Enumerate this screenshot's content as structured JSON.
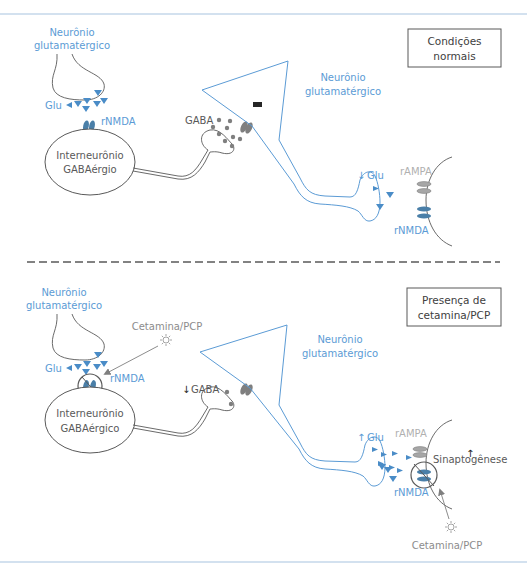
{
  "colors": {
    "neuron_blue": "#5b9bd5",
    "glu_marker": "#4a8cc7",
    "receptor_nmda": "#4a7fa8",
    "receptor_gray": "#8c8c8c",
    "gaba_dot": "#7f7f7f",
    "outline": "#595959",
    "frame_line": "#a8c4e0",
    "ketamine": "#999999"
  },
  "panels": [
    {
      "id": "normal",
      "condition_box": {
        "line1": "Condições",
        "line2": "normais"
      },
      "presynaptic_neuron": {
        "line1": "Neurônio",
        "line2": "glutamatérgico"
      },
      "glu_label": "Glu",
      "nmda_label": "rNMDA",
      "interneuron": {
        "line1": "Interneurônio",
        "line2": "GABAérgio"
      },
      "gaba_label": "GABA",
      "inhibition_symbol": "−",
      "pyramidal_neuron": {
        "line1": "Neurônio",
        "line2": "glutamatérgico"
      },
      "glu_output_label": "Glu",
      "glu_output_arrow": "↓",
      "ampa_label": "rAMPA",
      "nmda_post_label": "rNMDA"
    },
    {
      "id": "ketamine",
      "condition_box": {
        "line1": "Presença de",
        "line2": "cetamina/PCP"
      },
      "presynaptic_neuron": {
        "line1": "Neurônio",
        "line2": "glutamatérgico"
      },
      "glu_label": "Glu",
      "nmda_label": "rNMDA",
      "drug_label_top": "Cetamina/PCP",
      "interneuron": {
        "line1": "Interneurônio",
        "line2": "GABAérgico"
      },
      "gaba_label": "GABA",
      "gaba_arrow": "↓",
      "pyramidal_neuron": {
        "line1": "Neurônio",
        "line2": "glutamatérgico"
      },
      "glu_output_label": "Glu",
      "glu_output_arrow": "↑",
      "ampa_label": "rAMPA",
      "nmda_post_label": "rNMDA",
      "synaptogenesis_label": "Sinaptogênese",
      "synaptogenesis_arrow": "↑",
      "drug_label_bottom": "Cetamina/PCP"
    }
  ]
}
